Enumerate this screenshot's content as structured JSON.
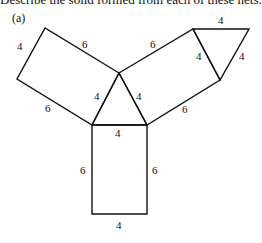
{
  "caption": "Describe the solid formed from each of these nets.",
  "part_label": "(a)",
  "net": {
    "description": "Net of a triangular prism: central equilateral triangle (side 4) with three 4×6 rectangles attached and one extra triangle",
    "center_triangle": {
      "sides": [
        "4",
        "4",
        "4"
      ]
    },
    "left_rectangle": {
      "short_side": "4",
      "long_sides": [
        "6",
        "6"
      ]
    },
    "right_rectangle": {
      "short_side": "4",
      "long_sides": [
        "6",
        "6"
      ]
    },
    "bottom_rectangle": {
      "top": "4",
      "bottom": "4",
      "left": "6",
      "right": "6"
    },
    "end_triangle": {
      "sides": [
        "4",
        "4",
        "4"
      ]
    }
  },
  "labels": {
    "left_rect_outer_short": "4",
    "left_rect_top_long": "6",
    "left_rect_bottom_long": "6",
    "tri_left": "4",
    "tri_right": "4",
    "tri_bottom": "4",
    "right_rect_top_long": "6",
    "right_rect_bottom_long": "6",
    "right_rect_short": "4",
    "end_tri_top": "4",
    "end_tri_right": "4",
    "bottom_rect_left": "6",
    "bottom_rect_right": "6",
    "bottom_rect_bottom": "4"
  }
}
